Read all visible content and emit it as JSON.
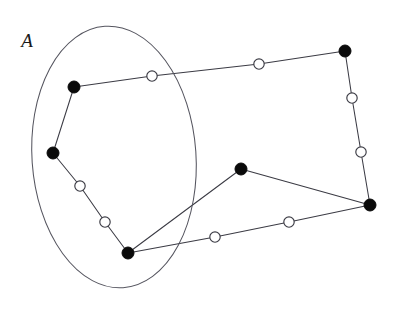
{
  "figure": {
    "width": 396,
    "height": 311,
    "background": "#ffffff",
    "type": "graph-diagram"
  },
  "labels": {
    "set_a": "A",
    "set_a_x": 27,
    "set_a_y": 47
  },
  "style": {
    "edge_color": "#3b3b44",
    "edge_width": 1.05,
    "boundary_color": "#55555f",
    "filled_node_color": "#0a0a0a",
    "open_node_fill": "#ffffff",
    "open_node_stroke": "#3b3b44",
    "filled_node_radius": 6,
    "open_node_radius": 5.2
  },
  "set_region": {
    "name": "A",
    "shape": "ellipse",
    "cx": 114,
    "cy": 157,
    "rx": 82,
    "ry": 131,
    "rotation": -4
  },
  "chart_data": {
    "type": "scatter",
    "title": "",
    "xlabel": "",
    "ylabel": "",
    "nodes": [
      {
        "id": "v1",
        "kind": "filled",
        "x": 74,
        "y": 87,
        "in_set_a": true
      },
      {
        "id": "v2",
        "kind": "filled",
        "x": 53,
        "y": 153,
        "in_set_a": true
      },
      {
        "id": "v3",
        "kind": "filled",
        "x": 128,
        "y": 253,
        "in_set_a": true
      },
      {
        "id": "v4",
        "kind": "filled",
        "x": 241,
        "y": 169,
        "in_set_a": false
      },
      {
        "id": "v5",
        "kind": "filled",
        "x": 370,
        "y": 205,
        "in_set_a": false
      },
      {
        "id": "v6",
        "kind": "filled",
        "x": 345,
        "y": 51,
        "in_set_a": false
      },
      {
        "id": "w1",
        "kind": "open",
        "x": 152,
        "y": 76,
        "in_set_a": true
      },
      {
        "id": "w2",
        "kind": "open",
        "x": 259,
        "y": 64,
        "in_set_a": false
      },
      {
        "id": "w3",
        "kind": "open",
        "x": 352,
        "y": 98,
        "in_set_a": false
      },
      {
        "id": "w4",
        "kind": "open",
        "x": 361,
        "y": 152,
        "in_set_a": false
      },
      {
        "id": "w5",
        "kind": "open",
        "x": 80,
        "y": 186,
        "in_set_a": true
      },
      {
        "id": "w6",
        "kind": "open",
        "x": 105,
        "y": 222,
        "in_set_a": true
      },
      {
        "id": "w7",
        "kind": "open",
        "x": 215,
        "y": 237,
        "in_set_a": false
      },
      {
        "id": "w8",
        "kind": "open",
        "x": 289,
        "y": 222,
        "in_set_a": false
      }
    ],
    "edges": [
      {
        "from": "v1",
        "to": "w1"
      },
      {
        "from": "w1",
        "to": "w2"
      },
      {
        "from": "w2",
        "to": "v6"
      },
      {
        "from": "v6",
        "to": "w3"
      },
      {
        "from": "w3",
        "to": "w4"
      },
      {
        "from": "w4",
        "to": "v5"
      },
      {
        "from": "v1",
        "to": "v2"
      },
      {
        "from": "v2",
        "to": "w5"
      },
      {
        "from": "w5",
        "to": "w6"
      },
      {
        "from": "w6",
        "to": "v3"
      },
      {
        "from": "v3",
        "to": "v4"
      },
      {
        "from": "v4",
        "to": "v5"
      },
      {
        "from": "v3",
        "to": "w7"
      },
      {
        "from": "w7",
        "to": "w8"
      },
      {
        "from": "w8",
        "to": "v5"
      }
    ]
  }
}
